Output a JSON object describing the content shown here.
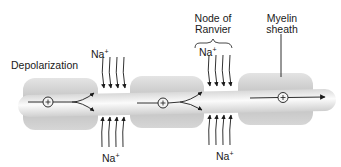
{
  "diagram": {
    "type": "saltatory-conduction",
    "labels": {
      "depolarization": "Depolarization",
      "node_of_ranvier_line1": "Node of",
      "node_of_ranvier_line2": "Ranvier",
      "myelin_line1": "Myelin",
      "myelin_line2": "sheath",
      "ion": "Na",
      "ion_charge": "+"
    },
    "nodes": [
      {
        "id": "node-1",
        "ion_top": "Na+",
        "ion_bottom": "Na+",
        "arrows_in": 8
      },
      {
        "id": "node-2",
        "ion_top": "Na+",
        "ion_bottom": "Na+",
        "arrows_in": 8
      }
    ],
    "myelin_segments": 3,
    "charge_symbol": "+",
    "colors": {
      "myelin": "#c9c9c9",
      "axon": "#ececec",
      "arrow": "#1a1a1a",
      "text": "#1a1a1a"
    }
  }
}
